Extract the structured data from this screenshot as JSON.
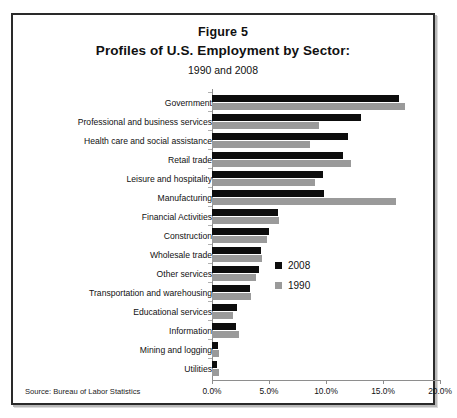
{
  "figure": {
    "label": "Figure 5",
    "title": "Profiles of U.S. Employment by Sector:",
    "subtitle": "1990 and 2008",
    "source": "Source: Bureau of Labor Statistics"
  },
  "colors": {
    "series_2008": "#0d0d0d",
    "series_1990": "#9a9a9a",
    "axis": "#8e8e8e",
    "border": "#2a2a2a",
    "background": "#ffffff",
    "text": "#111111"
  },
  "legend": {
    "position": "inside-right",
    "entries": [
      {
        "name": "2008",
        "color": "#0d0d0d"
      },
      {
        "name": "1990",
        "color": "#9a9a9a"
      }
    ]
  },
  "chart_data": {
    "type": "bar",
    "orientation": "horizontal",
    "title": "Profiles of U.S. Employment by Sector:",
    "subtitle": "1990 and 2008",
    "xlabel": "",
    "ylabel": "",
    "xlim": [
      0,
      20
    ],
    "xticks": [
      0,
      5,
      10,
      15,
      20
    ],
    "xtick_labels": [
      "0.0%",
      "5.0%",
      "10.0%",
      "15.0%",
      "20.0%"
    ],
    "grid": false,
    "units": "percent",
    "categories": [
      "Government",
      "Professional and business services",
      "Health care and social assistance",
      "Retail trade",
      "Leisure and hospitality",
      "Manufacturing",
      "Financial Activities",
      "Construction",
      "Wholesale trade",
      "Other services",
      "Transportation and warehousing",
      "Educational services",
      "Information",
      "Mining and logging",
      "Utilities"
    ],
    "series": [
      {
        "name": "2008",
        "color": "#0d0d0d",
        "values": [
          16.4,
          13.1,
          11.9,
          11.5,
          9.7,
          9.8,
          5.8,
          5.0,
          4.3,
          4.1,
          3.3,
          2.2,
          2.1,
          0.5,
          0.4
        ]
      },
      {
        "name": "1990",
        "color": "#9a9a9a",
        "values": [
          16.9,
          9.4,
          8.6,
          12.2,
          9.0,
          16.1,
          5.9,
          4.8,
          4.4,
          3.9,
          3.4,
          1.8,
          2.4,
          0.6,
          0.6
        ]
      }
    ]
  }
}
